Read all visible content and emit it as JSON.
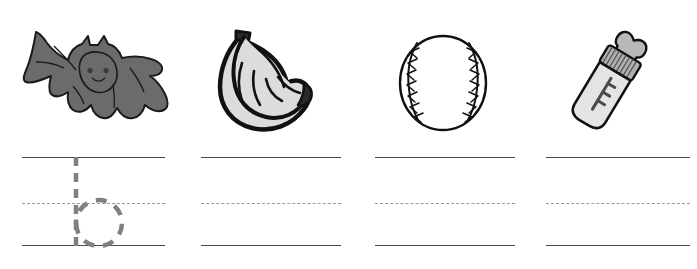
{
  "worksheet": {
    "title": "Letter B Handwriting Practice Worksheet",
    "letter": "b",
    "background_color": "#ffffff",
    "width": 697,
    "height": 269,
    "rule_line_color": "#4a4a4a",
    "dotted_midline_color": "#9a9a9a",
    "trace_guide_color": "#808080"
  },
  "columns": [
    {
      "index": 1,
      "picture": {
        "name": "bat",
        "label": "bat",
        "fill_color": "#6b6b6b",
        "outline_color": "#1a1a1a",
        "x": 18,
        "y": 28,
        "width": 152,
        "height": 104
      },
      "lines": {
        "x": 22,
        "width": 143,
        "top_y": 157,
        "mid_y": 203,
        "bottom_y": 245
      },
      "trace_guide": {
        "character": "b",
        "visible": true,
        "stroke_color": "#808080",
        "style": "dashed"
      }
    },
    {
      "index": 2,
      "picture": {
        "name": "bananas",
        "label": "bananas",
        "fill_color": "#dcdcdc",
        "outline_color": "#111111",
        "x": 214,
        "y": 27,
        "width": 102,
        "height": 108
      },
      "lines": {
        "x": 201,
        "width": 140,
        "top_y": 157,
        "mid_y": 203,
        "bottom_y": 245
      },
      "trace_guide": {
        "character": "",
        "visible": false,
        "stroke_color": "#808080",
        "style": "dashed"
      }
    },
    {
      "index": 3,
      "picture": {
        "name": "baseball",
        "label": "baseball",
        "fill_color": "#ffffff",
        "outline_color": "#111111",
        "x": 397,
        "y": 33,
        "width": 92,
        "height": 100
      },
      "lines": {
        "x": 375,
        "width": 140,
        "top_y": 157,
        "mid_y": 203,
        "bottom_y": 245
      },
      "trace_guide": {
        "character": "",
        "visible": false,
        "stroke_color": "#808080",
        "style": "dashed"
      }
    },
    {
      "index": 4,
      "picture": {
        "name": "baby-bottle",
        "label": "bottle",
        "fill_color": "#e4e4e4",
        "outline_color": "#111111",
        "x": 558,
        "y": 26,
        "width": 104,
        "height": 108
      },
      "lines": {
        "x": 546,
        "width": 144,
        "top_y": 157,
        "mid_y": 203,
        "bottom_y": 245
      },
      "trace_guide": {
        "character": "",
        "visible": false,
        "stroke_color": "#808080",
        "style": "dashed"
      }
    }
  ]
}
